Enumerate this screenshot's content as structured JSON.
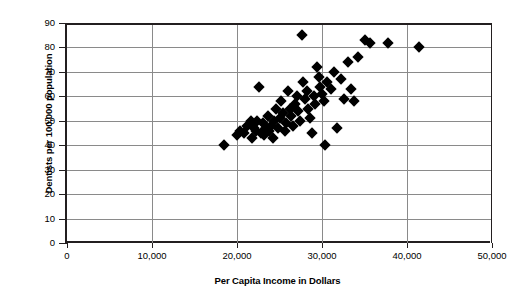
{
  "chart_data": {
    "type": "scatter",
    "title": "",
    "xlabel": "Per Capita Income in Dollars",
    "ylabel": "Dentists per 100,000 population",
    "xlim": [
      0,
      50000
    ],
    "ylim": [
      0,
      90
    ],
    "xticks": [
      0,
      10000,
      20000,
      30000,
      40000,
      50000
    ],
    "xtick_labels": [
      "0",
      "10,000",
      "20,000",
      "30,000",
      "40,000",
      "50,000"
    ],
    "yticks": [
      0,
      10,
      20,
      30,
      40,
      50,
      60,
      70,
      80,
      90
    ],
    "ytick_labels": [
      "0",
      "10",
      "20",
      "30",
      "40",
      "50",
      "60",
      "70",
      "80",
      "90"
    ],
    "grid": "horizontal-and-vertical",
    "legend": "none",
    "marker": "diamond",
    "marker_color": "#000000",
    "points": [
      {
        "x": 18500,
        "y": 40
      },
      {
        "x": 20000,
        "y": 44
      },
      {
        "x": 20400,
        "y": 46
      },
      {
        "x": 20800,
        "y": 45
      },
      {
        "x": 21200,
        "y": 48
      },
      {
        "x": 21600,
        "y": 50
      },
      {
        "x": 21800,
        "y": 43
      },
      {
        "x": 22000,
        "y": 47
      },
      {
        "x": 22200,
        "y": 46
      },
      {
        "x": 22400,
        "y": 50
      },
      {
        "x": 22600,
        "y": 64
      },
      {
        "x": 22800,
        "y": 45
      },
      {
        "x": 23000,
        "y": 49
      },
      {
        "x": 23200,
        "y": 44
      },
      {
        "x": 23400,
        "y": 47
      },
      {
        "x": 23600,
        "y": 52
      },
      {
        "x": 23800,
        "y": 46
      },
      {
        "x": 24000,
        "y": 48
      },
      {
        "x": 24200,
        "y": 43
      },
      {
        "x": 24400,
        "y": 50
      },
      {
        "x": 24600,
        "y": 55
      },
      {
        "x": 24800,
        "y": 47
      },
      {
        "x": 25000,
        "y": 51
      },
      {
        "x": 25200,
        "y": 58
      },
      {
        "x": 25400,
        "y": 53
      },
      {
        "x": 25600,
        "y": 46
      },
      {
        "x": 25800,
        "y": 49
      },
      {
        "x": 26000,
        "y": 62
      },
      {
        "x": 26200,
        "y": 55
      },
      {
        "x": 26400,
        "y": 52
      },
      {
        "x": 26600,
        "y": 48
      },
      {
        "x": 26800,
        "y": 57
      },
      {
        "x": 27000,
        "y": 60
      },
      {
        "x": 27200,
        "y": 54
      },
      {
        "x": 27400,
        "y": 50
      },
      {
        "x": 27600,
        "y": 85
      },
      {
        "x": 27800,
        "y": 66
      },
      {
        "x": 28000,
        "y": 59
      },
      {
        "x": 28200,
        "y": 62
      },
      {
        "x": 28400,
        "y": 55
      },
      {
        "x": 28600,
        "y": 51
      },
      {
        "x": 28800,
        "y": 45
      },
      {
        "x": 29000,
        "y": 60
      },
      {
        "x": 29200,
        "y": 57
      },
      {
        "x": 29400,
        "y": 72
      },
      {
        "x": 29600,
        "y": 68
      },
      {
        "x": 29800,
        "y": 64
      },
      {
        "x": 30000,
        "y": 61
      },
      {
        "x": 30200,
        "y": 58
      },
      {
        "x": 30400,
        "y": 40
      },
      {
        "x": 30600,
        "y": 66
      },
      {
        "x": 31000,
        "y": 63
      },
      {
        "x": 31400,
        "y": 70
      },
      {
        "x": 31800,
        "y": 47
      },
      {
        "x": 32200,
        "y": 67
      },
      {
        "x": 32600,
        "y": 59
      },
      {
        "x": 33000,
        "y": 74
      },
      {
        "x": 33400,
        "y": 63
      },
      {
        "x": 33800,
        "y": 58
      },
      {
        "x": 34200,
        "y": 76
      },
      {
        "x": 35000,
        "y": 83
      },
      {
        "x": 35600,
        "y": 82
      },
      {
        "x": 37800,
        "y": 82
      },
      {
        "x": 41400,
        "y": 80
      }
    ]
  }
}
